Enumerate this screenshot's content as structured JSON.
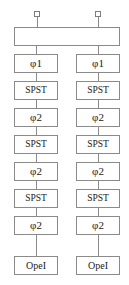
{
  "diagram": {
    "canvas": {
      "width": 129,
      "height": 285
    },
    "colors": {
      "background": "#ffffff",
      "border": "#8a8a8a",
      "wire": "#8a8a8a",
      "text": "#1b1b1b",
      "terminal_border": "#7d7d7d"
    },
    "terminals": [
      {
        "label": "",
        "x": 34,
        "y": 11,
        "side": "left-input"
      },
      {
        "label": "",
        "x": 95,
        "y": 11,
        "side": "right-input"
      }
    ],
    "crossover": {
      "label": "",
      "x": 14,
      "y": 27,
      "width": 106,
      "height": 19,
      "in_left_x": 37,
      "in_right_x": 98,
      "out_left_x": 37,
      "out_right_x": 98
    },
    "columns": [
      {
        "name": "left-chain",
        "x": 14,
        "width": 44,
        "center_x": 36,
        "stages": [
          {
            "label": "φ1",
            "type": "phase",
            "y": 54,
            "height": 19
          },
          {
            "label": "SPST",
            "type": "switch",
            "y": 81,
            "height": 19
          },
          {
            "label": "φ2",
            "type": "phase",
            "y": 108,
            "height": 19
          },
          {
            "label": "SPST",
            "type": "switch",
            "y": 135,
            "height": 19
          },
          {
            "label": "φ2",
            "type": "phase",
            "y": 162,
            "height": 19
          },
          {
            "label": "SPST",
            "type": "switch",
            "y": 189,
            "height": 19
          },
          {
            "label": "φ2",
            "type": "phase",
            "y": 216,
            "height": 19
          },
          {
            "label": "OpeI",
            "type": "opamp",
            "y": 256,
            "height": 19
          }
        ]
      },
      {
        "name": "right-chain",
        "x": 76,
        "width": 44,
        "center_x": 98,
        "stages": [
          {
            "label": "φ1",
            "type": "phase",
            "y": 54,
            "height": 19
          },
          {
            "label": "SPST",
            "type": "switch",
            "y": 81,
            "height": 19
          },
          {
            "label": "φ2",
            "type": "phase",
            "y": 108,
            "height": 19
          },
          {
            "label": "SPST",
            "type": "switch",
            "y": 135,
            "height": 19
          },
          {
            "label": "φ2",
            "type": "phase",
            "y": 162,
            "height": 19
          },
          {
            "label": "SPST",
            "type": "switch",
            "y": 189,
            "height": 19
          },
          {
            "label": "φ2",
            "type": "phase",
            "y": 216,
            "height": 19
          },
          {
            "label": "OpeI",
            "type": "opamp",
            "y": 256,
            "height": 19
          }
        ]
      }
    ]
  }
}
